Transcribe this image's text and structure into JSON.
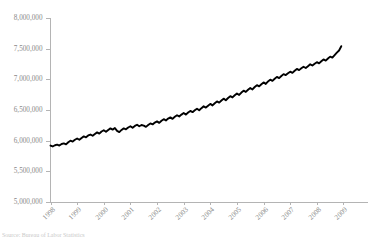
{
  "caption": {
    "text": "Source: Bureau of Labor Statistics"
  },
  "chart_data": {
    "type": "line",
    "title": "",
    "subtitle": "",
    "xlabel": "",
    "ylabel": "",
    "grid": false,
    "legend": false,
    "legend_position": "none",
    "line_color": "#000000",
    "axis_color": "#b4b4b4",
    "tick_label_color": "#888888",
    "ylim": [
      5000000,
      8000000
    ],
    "ytick_values": [
      5000000,
      5500000,
      6000000,
      6500000,
      7000000,
      7500000,
      8000000
    ],
    "ytick_labels": [
      "5,000,000",
      "5,500,000",
      "6,000,000",
      "6,500,000",
      "7,000,000",
      "7,500,000",
      "8,000,000"
    ],
    "xtick_labels": [
      "1998",
      "1999",
      "2000",
      "2001",
      "2002",
      "2003",
      "2004",
      "2005",
      "2006",
      "2007",
      "2008",
      "2009"
    ],
    "xlim": [
      1998,
      2009.92
    ],
    "x_tick_rotation_degrees": 45,
    "series": [
      {
        "name": "Series 1",
        "x": [
          1998.0,
          1998.083,
          1998.167,
          1998.25,
          1998.333,
          1998.417,
          1998.5,
          1998.583,
          1998.667,
          1998.75,
          1998.833,
          1998.917,
          1999.0,
          1999.083,
          1999.167,
          1999.25,
          1999.333,
          1999.417,
          1999.5,
          1999.583,
          1999.667,
          1999.75,
          1999.833,
          1999.917,
          2000.0,
          2000.083,
          2000.167,
          2000.25,
          2000.333,
          2000.417,
          2000.5,
          2000.583,
          2000.667,
          2000.75,
          2000.833,
          2000.917,
          2001.0,
          2001.083,
          2001.167,
          2001.25,
          2001.333,
          2001.417,
          2001.5,
          2001.583,
          2001.667,
          2001.75,
          2001.833,
          2001.917,
          2002.0,
          2002.083,
          2002.167,
          2002.25,
          2002.333,
          2002.417,
          2002.5,
          2002.583,
          2002.667,
          2002.75,
          2002.833,
          2002.917,
          2003.0,
          2003.083,
          2003.167,
          2003.25,
          2003.333,
          2003.417,
          2003.5,
          2003.583,
          2003.667,
          2003.75,
          2003.833,
          2003.917,
          2004.0,
          2004.083,
          2004.167,
          2004.25,
          2004.333,
          2004.417,
          2004.5,
          2004.583,
          2004.667,
          2004.75,
          2004.833,
          2004.917,
          2005.0,
          2005.083,
          2005.167,
          2005.25,
          2005.333,
          2005.417,
          2005.5,
          2005.583,
          2005.667,
          2005.75,
          2005.833,
          2005.917,
          2006.0,
          2006.083,
          2006.167,
          2006.25,
          2006.333,
          2006.417,
          2006.5,
          2006.583,
          2006.667,
          2006.75,
          2006.833,
          2006.917,
          2007.0,
          2007.083,
          2007.167,
          2007.25,
          2007.333,
          2007.417,
          2007.5,
          2007.583,
          2007.667,
          2007.75,
          2007.833,
          2007.917,
          2008.0,
          2008.083,
          2008.167,
          2008.25,
          2008.333,
          2008.417,
          2008.5,
          2008.583,
          2008.667,
          2008.75,
          2008.833,
          2008.917
        ],
        "values": [
          5920000,
          5905000,
          5925000,
          5935000,
          5920000,
          5945000,
          5955000,
          5940000,
          5975000,
          6000000,
          5985000,
          6015000,
          6035000,
          6015000,
          6045000,
          6070000,
          6055000,
          6085000,
          6100000,
          6080000,
          6110000,
          6135000,
          6115000,
          6150000,
          6170000,
          6145000,
          6175000,
          6200000,
          6180000,
          6205000,
          6160000,
          6140000,
          6175000,
          6200000,
          6185000,
          6215000,
          6235000,
          6210000,
          6240000,
          6260000,
          6235000,
          6255000,
          6245000,
          6225000,
          6255000,
          6280000,
          6265000,
          6295000,
          6315000,
          6290000,
          6325000,
          6350000,
          6330000,
          6360000,
          6380000,
          6355000,
          6390000,
          6415000,
          6395000,
          6425000,
          6450000,
          6425000,
          6460000,
          6485000,
          6465000,
          6495000,
          6520000,
          6495000,
          6530000,
          6560000,
          6540000,
          6570000,
          6600000,
          6575000,
          6610000,
          6640000,
          6620000,
          6655000,
          6685000,
          6660000,
          6695000,
          6725000,
          6705000,
          6740000,
          6770000,
          6745000,
          6785000,
          6815000,
          6795000,
          6830000,
          6860000,
          6835000,
          6875000,
          6905000,
          6885000,
          6920000,
          6950000,
          6925000,
          6965000,
          6995000,
          6975000,
          7010000,
          7040000,
          7020000,
          7055000,
          7085000,
          7070000,
          7100000,
          7125000,
          7105000,
          7140000,
          7170000,
          7150000,
          7180000,
          7205000,
          7185000,
          7215000,
          7245000,
          7225000,
          7255000,
          7280000,
          7260000,
          7295000,
          7325000,
          7305000,
          7340000,
          7370000,
          7355000,
          7395000,
          7435000,
          7470000,
          7540000
        ]
      }
    ]
  }
}
